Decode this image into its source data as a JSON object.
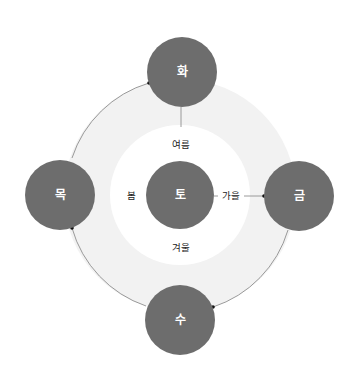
{
  "diagram": {
    "colors": {
      "node_fill": "#6d6d6d",
      "ring_fill": "#f2f2f2",
      "inner_fill": "#ffffff",
      "arc_stroke": "#8f8f8f",
      "node_text": "#ffffff",
      "label_text": "#222222"
    },
    "nodes": [
      {
        "id": "fire",
        "label": "화"
      },
      {
        "id": "wood",
        "label": "목"
      },
      {
        "id": "earth",
        "label": "토"
      },
      {
        "id": "metal",
        "label": "금"
      },
      {
        "id": "water",
        "label": "수"
      }
    ],
    "seasons": [
      {
        "id": "summer",
        "label": "여름"
      },
      {
        "id": "spring",
        "label": "봄"
      },
      {
        "id": "autumn",
        "label": "가을"
      },
      {
        "id": "winter",
        "label": "겨울"
      }
    ],
    "edges": [
      {
        "from": "목",
        "to": "화",
        "type": "arc"
      },
      {
        "from": "수",
        "to": "목",
        "type": "arc"
      },
      {
        "from": "금",
        "to": "수",
        "type": "arc"
      },
      {
        "from": "화",
        "to": "토",
        "type": "line"
      },
      {
        "from": "토",
        "to": "금",
        "type": "line",
        "via_label": "가을"
      }
    ]
  }
}
